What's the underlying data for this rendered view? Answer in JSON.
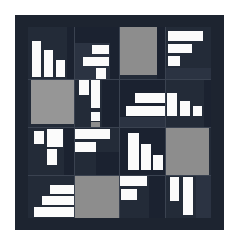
{
  "artwork": {
    "title": "Abstract Geometric Quilt Composition",
    "medium_note": "four-by-four block grid of light bars on dark ground",
    "canvas": {
      "width": 239,
      "height": 244
    },
    "palette": {
      "page_background": "#ffffff",
      "border_dark": "#1d2430",
      "field_dark": "#232b38",
      "field_dark_alt": "#1b2230",
      "field_dark_light": "#2b3342",
      "gray": "#8d8d8d",
      "gray_alt": "#969696",
      "white": "#fbfbfb",
      "grid_line": "#3a4250"
    },
    "frame": {
      "x": 15,
      "y": 15,
      "width": 209,
      "height": 215,
      "border_thickness": 12
    },
    "field": {
      "x": 13,
      "y": 12,
      "width": 183,
      "height": 191
    },
    "grid": {
      "columns": 4,
      "rows": 4,
      "column_edges": [
        0,
        46,
        91,
        137,
        183
      ],
      "row_edges": [
        0,
        52,
        100,
        148,
        191
      ]
    },
    "blocks": [
      {
        "id": "r1c1",
        "name": "descending-bar-staircase",
        "x": 0,
        "y": 0,
        "width": 46,
        "height": 52,
        "ground": "f-dark",
        "shapes": [
          {
            "fill": "f-white",
            "x": 4,
            "y": 14,
            "w": 9,
            "h": 36
          },
          {
            "fill": "f-white",
            "x": 16,
            "y": 23,
            "w": 9,
            "h": 27
          },
          {
            "fill": "f-white",
            "x": 28,
            "y": 33,
            "w": 9,
            "h": 17
          },
          {
            "fill": "f-dark2",
            "x": 39,
            "y": 0,
            "w": 7,
            "h": 52
          }
        ]
      },
      {
        "id": "r1c2",
        "name": "stepped-bars-dark-ground",
        "x": 46,
        "y": 0,
        "width": 45,
        "height": 52,
        "ground": "f-dark3",
        "shapes": [
          {
            "fill": "f-dark2",
            "x": 0,
            "y": 0,
            "w": 45,
            "h": 16
          },
          {
            "fill": "f-white",
            "x": 18,
            "y": 18,
            "w": 17,
            "h": 9
          },
          {
            "fill": "f-white",
            "x": 9,
            "y": 30,
            "w": 26,
            "h": 9
          },
          {
            "fill": "f-white",
            "x": 22,
            "y": 41,
            "w": 10,
            "h": 11
          },
          {
            "fill": "f-dark2",
            "x": 36,
            "y": 16,
            "w": 9,
            "h": 36
          }
        ]
      },
      {
        "id": "r1c3",
        "name": "large-gray-square",
        "x": 91,
        "y": 0,
        "width": 46,
        "height": 52,
        "ground": "f-dark",
        "shapes": [
          {
            "fill": "f-gray",
            "x": 0,
            "y": 0,
            "w": 38,
            "h": 48
          },
          {
            "fill": "f-dark2",
            "x": 38,
            "y": 0,
            "w": 8,
            "h": 52
          }
        ]
      },
      {
        "id": "r1c4",
        "name": "top-right-stacked-bars",
        "x": 137,
        "y": 0,
        "width": 46,
        "height": 52,
        "ground": "f-dark",
        "shapes": [
          {
            "fill": "f-white",
            "x": 3,
            "y": 4,
            "w": 35,
            "h": 10
          },
          {
            "fill": "f-white",
            "x": 3,
            "y": 17,
            "w": 24,
            "h": 9
          },
          {
            "fill": "f-white",
            "x": 3,
            "y": 29,
            "w": 12,
            "h": 10
          },
          {
            "fill": "f-dark3",
            "x": 0,
            "y": 41,
            "w": 46,
            "h": 11
          }
        ]
      },
      {
        "id": "r2c1",
        "name": "mid-left-gray-square",
        "x": 0,
        "y": 52,
        "width": 46,
        "height": 48,
        "ground": "f-dark",
        "shapes": [
          {
            "fill": "f-gray2",
            "x": 3,
            "y": 0,
            "w": 43,
            "h": 45
          }
        ]
      },
      {
        "id": "r2c2",
        "name": "vertical-bar-cluster",
        "x": 46,
        "y": 52,
        "width": 45,
        "height": 48,
        "ground": "f-dark",
        "shapes": [
          {
            "fill": "f-white",
            "x": 5,
            "y": 0,
            "w": 10,
            "h": 16
          },
          {
            "fill": "f-white",
            "x": 17,
            "y": 0,
            "w": 9,
            "h": 29
          },
          {
            "fill": "f-dark2",
            "x": 28,
            "y": 0,
            "w": 17,
            "h": 48
          },
          {
            "fill": "f-white",
            "x": 17,
            "y": 33,
            "w": 9,
            "h": 9
          },
          {
            "fill": "f-gray",
            "x": 17,
            "y": 43,
            "w": 9,
            "h": 5
          }
        ]
      },
      {
        "id": "r2c3",
        "name": "center-right-bars",
        "x": 91,
        "y": 52,
        "width": 46,
        "height": 48,
        "ground": "f-dark2",
        "shapes": [
          {
            "fill": "f-white",
            "x": 16,
            "y": 14,
            "w": 30,
            "h": 10
          },
          {
            "fill": "f-white",
            "x": 7,
            "y": 27,
            "w": 39,
            "h": 10
          },
          {
            "fill": "f-dark3",
            "x": 0,
            "y": 38,
            "w": 46,
            "h": 10
          }
        ]
      },
      {
        "id": "r2c4",
        "name": "right-vertical-bars",
        "x": 137,
        "y": 52,
        "width": 46,
        "height": 48,
        "ground": "f-dark",
        "shapes": [
          {
            "fill": "f-white",
            "x": 2,
            "y": 14,
            "w": 10,
            "h": 23
          },
          {
            "fill": "f-white",
            "x": 15,
            "y": 22,
            "w": 10,
            "h": 15
          },
          {
            "fill": "f-white",
            "x": 28,
            "y": 27,
            "w": 9,
            "h": 10
          },
          {
            "fill": "f-dark2",
            "x": 39,
            "y": 0,
            "w": 7,
            "h": 48
          }
        ]
      },
      {
        "id": "r3c1",
        "name": "lower-left-step-bars",
        "x": 0,
        "y": 100,
        "width": 46,
        "height": 48,
        "ground": "f-dark",
        "shapes": [
          {
            "fill": "f-white",
            "x": 6,
            "y": 4,
            "w": 10,
            "h": 13
          },
          {
            "fill": "f-white",
            "x": 19,
            "y": 2,
            "w": 16,
            "h": 18
          },
          {
            "fill": "f-white",
            "x": 19,
            "y": 22,
            "w": 10,
            "h": 16
          },
          {
            "fill": "f-dark2",
            "x": 36,
            "y": 0,
            "w": 10,
            "h": 48
          }
        ]
      },
      {
        "id": "r3c2",
        "name": "long-horizontal-bars",
        "x": 46,
        "y": 100,
        "width": 45,
        "height": 48,
        "ground": "f-dark",
        "shapes": [
          {
            "fill": "f-white",
            "x": -8,
            "y": 2,
            "w": 44,
            "h": 10
          },
          {
            "fill": "f-white",
            "x": -8,
            "y": 15,
            "w": 30,
            "h": 10
          },
          {
            "fill": "f-dark2",
            "x": 22,
            "y": 25,
            "w": 23,
            "h": 23
          }
        ]
      },
      {
        "id": "r3c3",
        "name": "center-vertical-pair",
        "x": 91,
        "y": 100,
        "width": 46,
        "height": 48,
        "ground": "f-dark2",
        "shapes": [
          {
            "fill": "f-white",
            "x": 9,
            "y": 6,
            "w": 11,
            "h": 37
          },
          {
            "fill": "f-white",
            "x": 22,
            "y": 17,
            "w": 10,
            "h": 26
          },
          {
            "fill": "f-white",
            "x": 34,
            "y": 28,
            "w": 10,
            "h": 15
          }
        ]
      },
      {
        "id": "r3c4",
        "name": "bottom-right-gray-square",
        "x": 137,
        "y": 100,
        "width": 46,
        "height": 48,
        "ground": "f-dark",
        "shapes": [
          {
            "fill": "f-gray",
            "x": 0,
            "y": 0,
            "w": 44,
            "h": 48
          }
        ]
      },
      {
        "id": "r4c1",
        "name": "ascending-horizontal-staircase",
        "x": 0,
        "y": 148,
        "width": 46,
        "height": 43,
        "ground": "f-dark",
        "shapes": [
          {
            "fill": "f-white",
            "x": 22,
            "y": 10,
            "w": 24,
            "h": 9
          },
          {
            "fill": "f-white",
            "x": 14,
            "y": 21,
            "w": 32,
            "h": 9
          },
          {
            "fill": "f-white",
            "x": 6,
            "y": 32,
            "w": 40,
            "h": 10
          }
        ]
      },
      {
        "id": "r4c2",
        "name": "bottom-gray-square",
        "x": 46,
        "y": 148,
        "width": 45,
        "height": 43,
        "ground": "f-dark",
        "shapes": [
          {
            "fill": "f-gray",
            "x": 0,
            "y": 0,
            "w": 45,
            "h": 43
          }
        ]
      },
      {
        "id": "r4c3",
        "name": "bottom-center-bars",
        "x": 91,
        "y": 148,
        "width": 46,
        "height": 43,
        "ground": "f-dark",
        "shapes": [
          {
            "fill": "f-white",
            "x": 0,
            "y": 1,
            "w": 28,
            "h": 10
          },
          {
            "fill": "f-white",
            "x": 2,
            "y": 14,
            "w": 16,
            "h": 11
          },
          {
            "fill": "f-dark2",
            "x": 30,
            "y": 0,
            "w": 16,
            "h": 43
          }
        ]
      },
      {
        "id": "r4c4",
        "name": "bottom-right-vertical-bars",
        "x": 137,
        "y": 148,
        "width": 46,
        "height": 43,
        "ground": "f-dark",
        "shapes": [
          {
            "fill": "f-white",
            "x": 5,
            "y": 2,
            "w": 9,
            "h": 24
          },
          {
            "fill": "f-white",
            "x": 18,
            "y": 2,
            "w": 10,
            "h": 38
          },
          {
            "fill": "f-dark3",
            "x": 31,
            "y": 0,
            "w": 15,
            "h": 43
          }
        ]
      }
    ],
    "grid_lines_vertical": [
      46,
      91,
      137
    ],
    "grid_lines_horizontal": [
      52,
      100,
      148
    ]
  }
}
